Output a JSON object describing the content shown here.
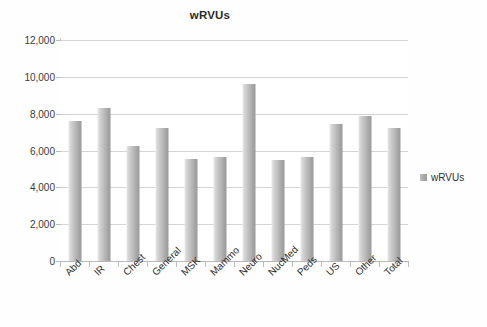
{
  "chart_data": {
    "type": "bar",
    "title": "wRVUs",
    "xlabel": "",
    "ylabel": "",
    "categories": [
      "Abd",
      "IR",
      "Chest",
      "General",
      "MSK",
      "Mammo",
      "Neuro",
      "NucMed",
      "Peds",
      "US",
      "Other",
      "Total"
    ],
    "series": [
      {
        "name": "wRVUs",
        "values": [
          7600,
          8300,
          6250,
          7200,
          5550,
          5650,
          9600,
          5500,
          5650,
          7450,
          7850,
          7200
        ]
      }
    ],
    "ylim": [
      0,
      12000
    ],
    "ytick_labels": [
      "0",
      "2,000",
      "4,000",
      "6,000",
      "8,000",
      "10,000",
      "12,000"
    ],
    "ytick_values": [
      0,
      2000,
      4000,
      6000,
      8000,
      10000,
      12000
    ],
    "grid": true,
    "legend_position": "right",
    "legend_entries": [
      "wRVUs"
    ],
    "bar_color": "#a8a8a8",
    "gridline_color": "#d5d5d5",
    "axis_color": "#bdbdbd",
    "title_color": "#2b2b2b"
  },
  "legend": {
    "swatch_icon": "legend-square-icon",
    "label": "wRVUs"
  },
  "caption": {
    "text": ""
  }
}
